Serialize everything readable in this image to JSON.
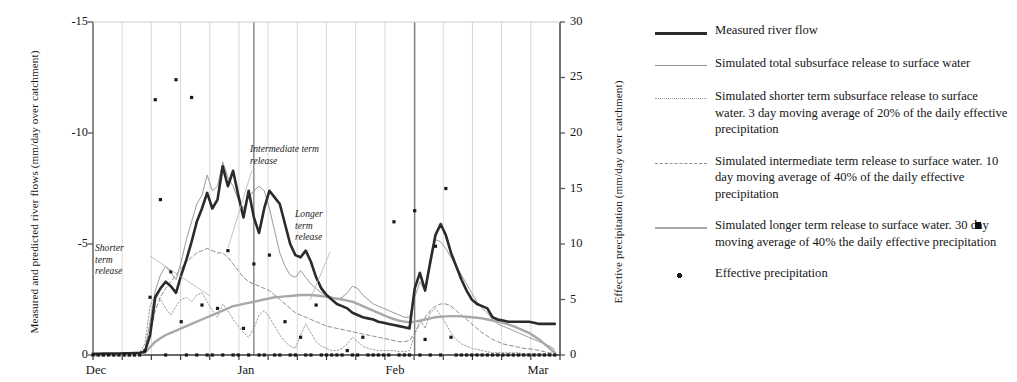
{
  "axes": {
    "y_left_title": "Measured and predicted river flows (mm/day over catchment)",
    "y_right_title": "Effective precipitation (mm/day over catchment)",
    "y_left_ticks": [
      "-15",
      "-10",
      "-5",
      "0"
    ],
    "y_right_ticks": [
      "30",
      "25",
      "20",
      "15",
      "10",
      "5",
      "0"
    ],
    "x_ticks": [
      "Dec",
      "Jan",
      "Feb",
      "Mar"
    ]
  },
  "annotations": [
    {
      "name": "shorter-term-release",
      "lines": [
        "Shorter",
        "term",
        "release"
      ]
    },
    {
      "name": "intermediate-term-release",
      "lines": [
        "Intermediate term",
        "release"
      ]
    },
    {
      "name": "longer-term-release",
      "lines": [
        "Longer",
        "term",
        "release"
      ]
    }
  ],
  "legend": {
    "items": [
      {
        "key": "solid-thick-black",
        "label": "Measured river flow"
      },
      {
        "key": "solid-thin-grey",
        "label": "Simulated total subsurface release to surface water"
      },
      {
        "key": "dotted-grey",
        "label": "Simulated shorter term subsurface release to surface water. 3 day moving average of 20% of the daily effective precipitation"
      },
      {
        "key": "dashed-grey",
        "label": "Simulated intermediate term release to surface water. 10 day moving average of 40% of the daily effective precipitation"
      },
      {
        "key": "solid-thick-grey",
        "label": "Simulated longer term release to surface water. 30 day moving average of 40% the daily effective precipitation"
      },
      {
        "key": "point-marker",
        "label": "Effective precipitation"
      }
    ]
  },
  "colors": {
    "measured_flow": "#2b2b2b",
    "total_subsurface": "#8f8f8f",
    "shorter_term": "#9a9a9a",
    "intermediate_term": "#8d8d8d",
    "longer_term": "#a8a8a8",
    "precipitation_marker": "#1a1a1a",
    "gridline": "#cfcfcf",
    "month_line": "#6e6e6e",
    "axis": "#5a5a5a"
  },
  "chart_data": {
    "type": "line",
    "title": "",
    "xlabel": "",
    "ylabel": "Measured and predicted river flows (mm/day over catchment)",
    "y2label": "Effective precipitation (mm/day over catchment)",
    "ylim": [
      0,
      15
    ],
    "y2lim": [
      0,
      30
    ],
    "y_inverted_labels": true,
    "grid": true,
    "legend_position": "right",
    "x": "days from 1 Dec to 1 Mar (90 days)",
    "xlim": [
      0,
      90
    ],
    "x_tick_values": [
      0,
      31,
      62,
      90
    ],
    "series": [
      {
        "name": "Measured river flow",
        "style": "solid-thick-black",
        "axis": "left",
        "values": [
          0.05,
          0.05,
          0.06,
          0.06,
          0.07,
          0.07,
          0.08,
          0.08,
          0.09,
          0.1,
          0.15,
          0.9,
          2.6,
          3.0,
          3.3,
          3.1,
          2.8,
          3.6,
          4.3,
          5.1,
          6.0,
          6.6,
          7.3,
          6.6,
          7.0,
          8.5,
          7.6,
          8.3,
          7.2,
          6.2,
          7.4,
          6.2,
          5.5,
          6.6,
          7.4,
          7.1,
          6.8,
          5.9,
          5.0,
          4.5,
          4.4,
          4.7,
          4.2,
          3.5,
          3.0,
          2.7,
          2.5,
          2.3,
          2.2,
          2.1,
          1.9,
          1.8,
          1.7,
          1.65,
          1.6,
          1.5,
          1.45,
          1.4,
          1.35,
          1.3,
          1.25,
          1.2,
          3.0,
          3.7,
          2.9,
          4.2,
          5.4,
          5.9,
          5.4,
          4.6,
          4.0,
          3.4,
          2.9,
          2.5,
          2.3,
          2.2,
          2.1,
          1.7,
          1.6,
          1.55,
          1.5,
          1.5,
          1.5,
          1.5,
          1.5,
          1.45,
          1.4,
          1.4,
          1.4,
          1.4
        ]
      },
      {
        "name": "Simulated total subsurface release to surface water",
        "style": "solid-thin-grey",
        "axis": "left",
        "values": [
          0.0,
          0.0,
          0.0,
          0.0,
          0.0,
          0.0,
          0.0,
          0.0,
          0.0,
          0.05,
          0.2,
          1.5,
          2.9,
          3.6,
          4.0,
          3.7,
          3.4,
          4.2,
          5.2,
          6.0,
          6.8,
          7.2,
          8.1,
          7.4,
          7.6,
          8.7,
          8.0,
          7.6,
          7.0,
          6.6,
          7.1,
          7.4,
          7.6,
          7.4,
          6.6,
          5.6,
          4.6,
          4.0,
          3.6,
          3.5,
          3.8,
          3.5,
          3.2,
          3.0,
          2.8,
          2.7,
          2.6,
          2.5,
          2.6,
          2.8,
          3.1,
          3.0,
          2.7,
          2.5,
          2.3,
          2.2,
          2.1,
          2.0,
          1.9,
          1.8,
          1.7,
          1.7,
          2.6,
          3.3,
          2.9,
          4.0,
          5.2,
          5.1,
          4.8,
          4.4,
          4.0,
          3.6,
          3.2,
          2.8,
          2.4,
          2.1,
          1.9,
          1.6,
          1.4,
          1.3,
          1.2,
          1.1,
          1.0,
          0.9,
          0.8,
          0.7,
          0.6,
          0.5,
          0.4,
          0.25
        ]
      },
      {
        "name": "Simulated shorter term subsurface release to surface water",
        "style": "dotted-grey",
        "axis": "left",
        "values": [
          0,
          0,
          0,
          0,
          0,
          0,
          0,
          0,
          0,
          0.1,
          0.5,
          2.2,
          2.7,
          2.5,
          2.1,
          1.8,
          2.2,
          2.5,
          2.6,
          2.4,
          2.7,
          2.8,
          2.4,
          2.0,
          1.7,
          2.3,
          2.0,
          1.6,
          1.3,
          1.0,
          0.8,
          1.2,
          1.8,
          2.0,
          1.7,
          1.3,
          0.9,
          0.6,
          0.4,
          0.3,
          0.9,
          1.4,
          1.0,
          0.6,
          0.4,
          0.3,
          0.2,
          0.2,
          0.3,
          0.5,
          0.8,
          0.6,
          0.4,
          0.3,
          0.25,
          0.2,
          0.2,
          0.2,
          0.2,
          0.15,
          0.15,
          0.2,
          0.9,
          1.6,
          1.2,
          1.9,
          2.1,
          1.8,
          1.4,
          1.0,
          0.7,
          0.5,
          0.4,
          0.3,
          0.25,
          0.2,
          0.15,
          0.1,
          0.1,
          0.1,
          0.1,
          0.1,
          0.1,
          0.05,
          0.05,
          0.05,
          0.05,
          0.05,
          0.05,
          0.0
        ]
      },
      {
        "name": "Simulated intermediate term release to surface water",
        "style": "dashed-grey",
        "axis": "left",
        "values": [
          0,
          0,
          0,
          0,
          0,
          0,
          0,
          0,
          0,
          0.05,
          0.2,
          1.0,
          2.0,
          2.6,
          3.0,
          3.3,
          3.6,
          3.9,
          4.2,
          4.4,
          4.6,
          4.7,
          4.8,
          4.7,
          4.6,
          4.6,
          4.4,
          4.1,
          3.8,
          3.5,
          3.3,
          3.2,
          3.1,
          3.0,
          2.9,
          2.7,
          2.5,
          2.3,
          2.1,
          1.9,
          1.8,
          1.7,
          1.6,
          1.5,
          1.4,
          1.3,
          1.25,
          1.2,
          1.15,
          1.1,
          1.05,
          1.0,
          0.95,
          0.9,
          0.85,
          0.8,
          0.75,
          0.7,
          0.65,
          0.6,
          0.6,
          0.65,
          1.0,
          1.4,
          1.7,
          2.0,
          2.2,
          2.3,
          2.3,
          2.2,
          2.0,
          1.8,
          1.6,
          1.4,
          1.2,
          1.0,
          0.85,
          0.7,
          0.6,
          0.5,
          0.45,
          0.4,
          0.35,
          0.3,
          0.28,
          0.25,
          0.2,
          0.15,
          0.1,
          0.05
        ]
      },
      {
        "name": "Simulated longer term release to surface water",
        "style": "solid-thick-grey",
        "axis": "left",
        "values": [
          0,
          0,
          0,
          0,
          0,
          0,
          0,
          0,
          0,
          0.02,
          0.1,
          0.35,
          0.6,
          0.75,
          0.9,
          1.0,
          1.1,
          1.2,
          1.3,
          1.4,
          1.5,
          1.6,
          1.7,
          1.8,
          1.9,
          2.0,
          2.1,
          2.2,
          2.25,
          2.3,
          2.35,
          2.4,
          2.45,
          2.5,
          2.55,
          2.6,
          2.62,
          2.64,
          2.66,
          2.68,
          2.7,
          2.7,
          2.7,
          2.68,
          2.66,
          2.62,
          2.58,
          2.54,
          2.5,
          2.45,
          2.4,
          2.3,
          2.2,
          2.1,
          2.0,
          1.9,
          1.8,
          1.7,
          1.62,
          1.55,
          1.5,
          1.48,
          1.5,
          1.55,
          1.6,
          1.65,
          1.7,
          1.72,
          1.74,
          1.75,
          1.75,
          1.74,
          1.72,
          1.7,
          1.68,
          1.65,
          1.6,
          1.55,
          1.5,
          1.45,
          1.38,
          1.3,
          1.2,
          1.1,
          1.0,
          0.85,
          0.7,
          0.5,
          0.3,
          0.1
        ]
      }
    ],
    "scatter": {
      "name": "Effective precipitation",
      "style": "point-marker",
      "axis": "right",
      "points": [
        [
          0,
          0
        ],
        [
          1,
          0
        ],
        [
          2,
          0
        ],
        [
          3,
          0
        ],
        [
          4,
          0
        ],
        [
          5,
          0
        ],
        [
          6,
          0
        ],
        [
          7,
          0
        ],
        [
          8,
          0
        ],
        [
          9,
          0
        ],
        [
          10,
          0.4
        ],
        [
          11,
          5.2
        ],
        [
          12,
          23.0
        ],
        [
          13,
          14.0
        ],
        [
          14,
          0
        ],
        [
          15,
          7.5
        ],
        [
          16,
          24.8
        ],
        [
          17,
          3.0
        ],
        [
          18,
          0
        ],
        [
          19,
          23.2
        ],
        [
          20,
          0
        ],
        [
          21,
          4.5
        ],
        [
          22,
          0
        ],
        [
          23,
          0
        ],
        [
          24,
          4.2
        ],
        [
          25,
          0
        ],
        [
          26,
          9.4
        ],
        [
          27,
          0
        ],
        [
          28,
          0
        ],
        [
          29,
          2.4
        ],
        [
          30,
          0
        ],
        [
          31,
          8.2
        ],
        [
          32,
          0
        ],
        [
          33,
          0
        ],
        [
          34,
          9.0
        ],
        [
          35,
          0
        ],
        [
          36,
          0
        ],
        [
          37,
          3.0
        ],
        [
          38,
          0
        ],
        [
          39,
          0
        ],
        [
          40,
          1.6
        ],
        [
          41,
          0
        ],
        [
          42,
          0
        ],
        [
          43,
          4.5
        ],
        [
          44,
          0
        ],
        [
          45,
          0
        ],
        [
          46,
          0
        ],
        [
          47,
          0
        ],
        [
          48,
          0
        ],
        [
          49,
          0.4
        ],
        [
          50,
          0
        ],
        [
          51,
          0
        ],
        [
          52,
          1.6
        ],
        [
          53,
          0
        ],
        [
          54,
          0
        ],
        [
          55,
          0
        ],
        [
          56,
          0
        ],
        [
          57,
          0
        ],
        [
          58,
          12.0
        ],
        [
          59,
          0
        ],
        [
          60,
          0
        ],
        [
          61,
          0
        ],
        [
          62,
          13.0
        ],
        [
          63,
          0
        ],
        [
          64,
          1.4
        ],
        [
          65,
          0
        ],
        [
          66,
          9.8
        ],
        [
          67,
          0
        ],
        [
          68,
          15.0
        ],
        [
          69,
          1.6
        ],
        [
          70,
          0
        ],
        [
          71,
          0
        ],
        [
          72,
          0
        ],
        [
          73,
          0
        ],
        [
          74,
          0
        ],
        [
          75,
          0
        ],
        [
          76,
          0
        ],
        [
          77,
          0
        ],
        [
          78,
          0
        ],
        [
          79,
          0
        ],
        [
          80,
          0
        ],
        [
          81,
          0
        ],
        [
          82,
          0
        ],
        [
          83,
          0
        ],
        [
          84,
          0
        ],
        [
          85,
          0
        ],
        [
          86,
          0
        ],
        [
          87,
          0
        ],
        [
          88,
          0
        ],
        [
          89,
          0
        ]
      ]
    }
  }
}
